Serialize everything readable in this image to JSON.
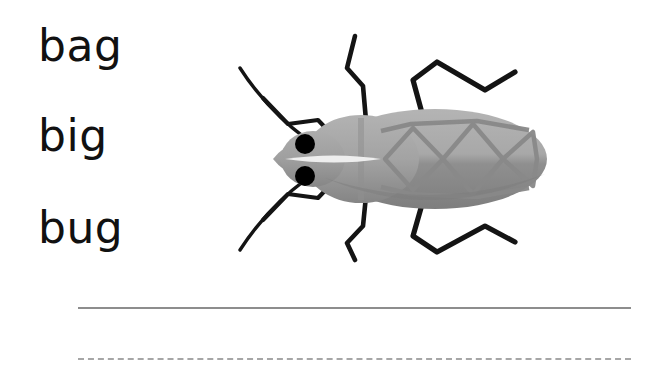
{
  "worksheet": {
    "type": "phonics-word-choice-handwriting",
    "background_color": "#ffffff",
    "word_choices": [
      {
        "label": "bag"
      },
      {
        "label": "big"
      },
      {
        "label": "bug"
      }
    ],
    "illustration": {
      "subject": "bug",
      "alt_text": "Gray cartoon beetle bug seen from above, facing left, with two black eyes, two antennae and six legs",
      "colors": {
        "body_light": "#b0b0b0",
        "body_mid": "#9b9b9b",
        "body_dark": "#808080",
        "head": "#a5a5a5",
        "wing_pattern": "#8a8a8a",
        "highlight": "#e8e8e8",
        "eye": "#000000",
        "legs": "#141414"
      },
      "parts": {
        "eyes": 2,
        "antennae": 2,
        "legs": 6,
        "wing_pattern": "diamond-zigzag"
      }
    },
    "writing_lines": [
      {
        "style": "solid",
        "color": "#8d8d8d"
      },
      {
        "style": "dashed",
        "color": "#a6a6a6"
      }
    ]
  }
}
